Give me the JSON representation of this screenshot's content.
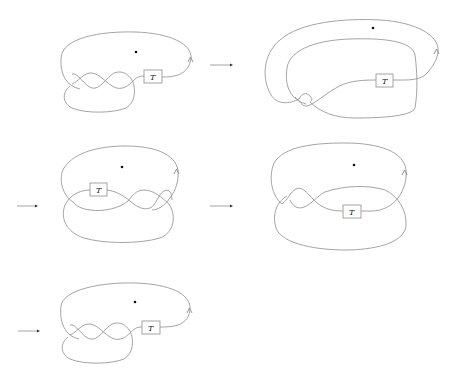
{
  "figure": {
    "colors": {
      "strand": "#9a9a9a",
      "dot": "#111111",
      "arrow": "#333333",
      "background": "#ffffff"
    },
    "tangle_label": "T",
    "panels": [
      {
        "id": 1,
        "tangle_label": "T",
        "has_basepoint_dot": true,
        "orientation_arrow": true
      },
      {
        "id": 2,
        "tangle_label": "T",
        "has_basepoint_dot": true,
        "orientation_arrow": true
      },
      {
        "id": 3,
        "tangle_label": "T",
        "has_basepoint_dot": true,
        "orientation_arrow": true
      },
      {
        "id": 4,
        "tangle_label": "T",
        "has_basepoint_dot": true,
        "orientation_arrow": true
      },
      {
        "id": 5,
        "tangle_label": "T",
        "has_basepoint_dot": true,
        "orientation_arrow": true
      }
    ],
    "transition_arrows": [
      {
        "from": 1,
        "to": 2
      },
      {
        "from": 2,
        "to": 3
      },
      {
        "from": 3,
        "to": 4
      },
      {
        "from": 4,
        "to": 5
      }
    ]
  }
}
